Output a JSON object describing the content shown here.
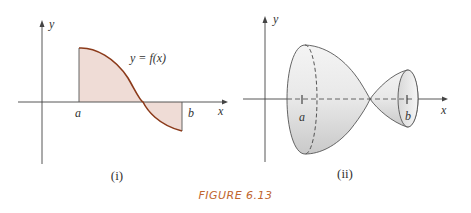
{
  "figure": {
    "caption": "FIGURE 6.13",
    "colors": {
      "curve": "#8b3a1a",
      "fill": "#efdcd6",
      "caption": "#c0652e",
      "axis": "#444444"
    },
    "panel_i": {
      "label": "(i)",
      "x_axis_label": "x",
      "y_axis_label": "y",
      "curve_label": "y = f(x)",
      "a_label": "a",
      "b_label": "b"
    },
    "panel_ii": {
      "label": "(ii)",
      "x_axis_label": "x",
      "y_axis_label": "y",
      "a_label": "a",
      "b_label": "b"
    }
  }
}
